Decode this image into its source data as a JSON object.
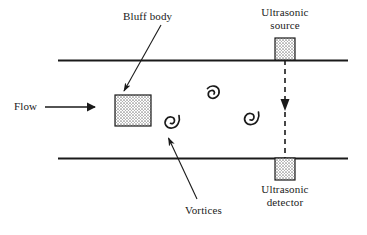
{
  "figure": {
    "name": "vortex-shedding-flowmeter-diagram",
    "width": 367,
    "height": 235,
    "background_color": "#ffffff",
    "line_color": "#1a1a1a",
    "hatch_fill_color": "#d0d0d0"
  },
  "labels": {
    "bluff_body": "Bluff body",
    "flow": "Flow",
    "vortices": "Vortices",
    "ultrasonic_source_line1": "Ultrasonic",
    "ultrasonic_source_line2": "source",
    "ultrasonic_detector_line1": "Ultrasonic",
    "ultrasonic_detector_line2": "detector"
  },
  "components": {
    "pipe": {
      "top_wall_y": 60,
      "bottom_wall_y": 158,
      "x_start": 58,
      "x_end": 348
    },
    "bluff_body": {
      "x": 115,
      "y": 95,
      "width": 36,
      "height": 31
    },
    "ultrasonic_source_block": {
      "x": 275,
      "y": 38,
      "width": 20,
      "height": 22
    },
    "ultrasonic_detector_block": {
      "x": 275,
      "y": 158,
      "width": 20,
      "height": 22
    },
    "ultrasonic_beam": {
      "x": 285,
      "y_start": 60,
      "y_end": 158,
      "style": "dashed",
      "direction": "down"
    },
    "flow_arrow": {
      "x_start": 45,
      "x_end": 97,
      "y": 107,
      "direction": "right"
    },
    "vortices": [
      {
        "id": "vortex-upper",
        "cx": 213,
        "cy": 93
      },
      {
        "id": "vortex-near-body",
        "cx": 172,
        "cy": 124
      },
      {
        "id": "vortex-downstream",
        "cx": 252,
        "cy": 120
      }
    ],
    "leader_lines": [
      {
        "id": "leader-bluff-body",
        "from_x": 160,
        "from_y": 26,
        "to_x": 124,
        "to_y": 92
      },
      {
        "id": "leader-vortices",
        "from_x": 196,
        "from_y": 200,
        "to_x": 168,
        "to_y": 139
      }
    ]
  }
}
